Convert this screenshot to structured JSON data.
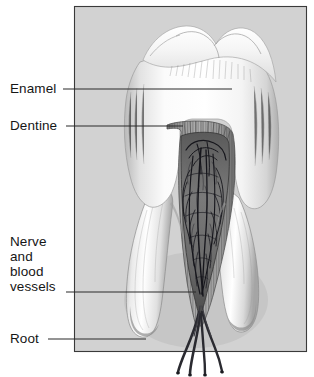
{
  "figure": {
    "width": 314,
    "height": 377,
    "background_color": "#ffffff",
    "panel_color": "#d2d2d2",
    "panel_border_color": "#3a3a3a",
    "leader_line_color": "#2b2b2b",
    "label_text_color": "#161616"
  },
  "labels": {
    "enamel": {
      "text": "Enamel",
      "leader_from_x": 63,
      "leader_to_x": 232,
      "leader_y": 89
    },
    "dentine": {
      "text": "Dentine",
      "leader_from_x": 66,
      "leader_to_x": 183,
      "leader_y": 126
    },
    "nerve_and_blood_vessels": {
      "line1": "Nerve",
      "line2": "and",
      "line3": "blood",
      "line4": "vessels",
      "leader_from_x": 66,
      "leader_to_x": 196,
      "leader_y": 292
    },
    "root": {
      "text": "Root",
      "leader_from_x": 48,
      "leader_to_x": 146,
      "leader_y": 339
    }
  },
  "illustration": {
    "description": "Pencil-shaded cross-section of a two-rooted molar showing white outer enamel, striated dentine layer, dark pulp chamber with branching nerve and blood vessel network, and a nerve bundle emerging below the root apices.",
    "parts": [
      "enamel-crown",
      "dentine-layer",
      "pulp-chamber",
      "vessel-network",
      "root-left",
      "root-right",
      "nerve-bundle"
    ]
  }
}
